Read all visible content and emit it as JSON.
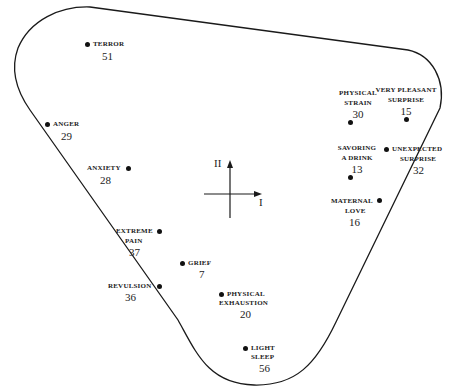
{
  "diagram": {
    "type": "two-dimensional emotion map",
    "axes": {
      "horizontal_label": "I",
      "vertical_label": "II"
    },
    "points": [
      {
        "id": "terror",
        "label_lines": [
          "TERROR"
        ],
        "number": "51"
      },
      {
        "id": "anger",
        "label_lines": [
          "ANGER"
        ],
        "number": "29"
      },
      {
        "id": "anxiety",
        "label_lines": [
          "ANXIETY"
        ],
        "number": "28"
      },
      {
        "id": "extreme-pain",
        "label_lines": [
          "EXTREME",
          "PAIN"
        ],
        "number": "37"
      },
      {
        "id": "grief",
        "label_lines": [
          "GRIEF"
        ],
        "number": "7"
      },
      {
        "id": "revulsion",
        "label_lines": [
          "REVULSION"
        ],
        "number": "36"
      },
      {
        "id": "physical-exhaustion",
        "label_lines": [
          "PHYSICAL",
          "EXHAUSTION"
        ],
        "number": "20"
      },
      {
        "id": "light-sleep",
        "label_lines": [
          "LIGHT",
          "SLEEP"
        ],
        "number": "56"
      },
      {
        "id": "physical-strain",
        "label_lines": [
          "PHYSICAL",
          "STRAIN"
        ],
        "number": "30"
      },
      {
        "id": "very-pleasant-surprise",
        "label_lines": [
          "VERY PLEASANT",
          "SURPRISE"
        ],
        "number": "15"
      },
      {
        "id": "savoring-a-drink",
        "label_lines": [
          "SAVORING",
          "A DRINK"
        ],
        "number": "13"
      },
      {
        "id": "unexpected-surprise",
        "label_lines": [
          "UNEXPECTED",
          "SURPRISE"
        ],
        "number": "32"
      },
      {
        "id": "maternal-love",
        "label_lines": [
          "MATERNAL",
          "LOVE"
        ],
        "number": "16"
      }
    ],
    "colors": {
      "ink": "#111111",
      "background": "#ffffff"
    }
  }
}
